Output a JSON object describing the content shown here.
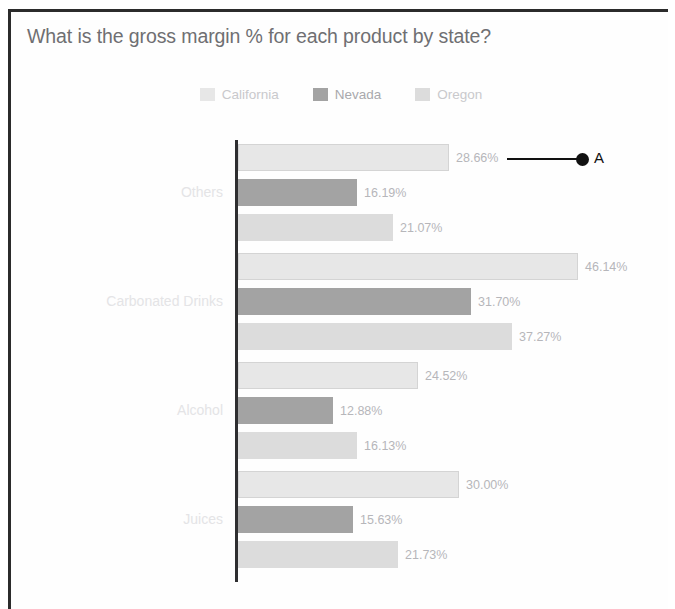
{
  "card": {
    "title": "What is the gross margin % for each product by state?"
  },
  "legend": {
    "items": [
      {
        "label": "California",
        "color": "#e7e7e7"
      },
      {
        "label": "Nevada",
        "color": "#a3a3a3"
      },
      {
        "label": "Oregon",
        "color": "#dcdcdc"
      }
    ]
  },
  "annotation": {
    "letter": "A"
  },
  "chart_data": {
    "type": "bar",
    "orientation": "horizontal",
    "title": "What is the gross margin % for each product by state?",
    "xlabel": "",
    "ylabel": "",
    "grid": false,
    "legend_position": "top-center",
    "value_format": "percent",
    "categories": [
      "Others",
      "Carbonated Drinks",
      "Alcohol",
      "Juices"
    ],
    "series": [
      {
        "name": "California",
        "color": "#e7e7e7",
        "values": [
          28.66,
          46.14,
          24.52,
          30.0
        ],
        "labels": [
          "28.66%",
          "46.14%",
          "24.52%",
          "30.00%"
        ]
      },
      {
        "name": "Nevada",
        "color": "#a3a3a3",
        "values": [
          16.19,
          31.7,
          12.88,
          15.63
        ],
        "labels": [
          "16.19%",
          "31.70%",
          "12.88%",
          "15.63%"
        ]
      },
      {
        "name": "Oregon",
        "color": "#dcdcdc",
        "values": [
          21.07,
          37.27,
          16.13,
          21.73
        ],
        "labels": [
          "21.07%",
          "37.27%",
          "16.13%",
          "21.73%"
        ]
      }
    ],
    "xlim": [
      0,
      46.14
    ],
    "annotations": [
      {
        "label": "A",
        "target_series": "California",
        "target_category": "Others",
        "target_value": 28.66
      }
    ]
  }
}
